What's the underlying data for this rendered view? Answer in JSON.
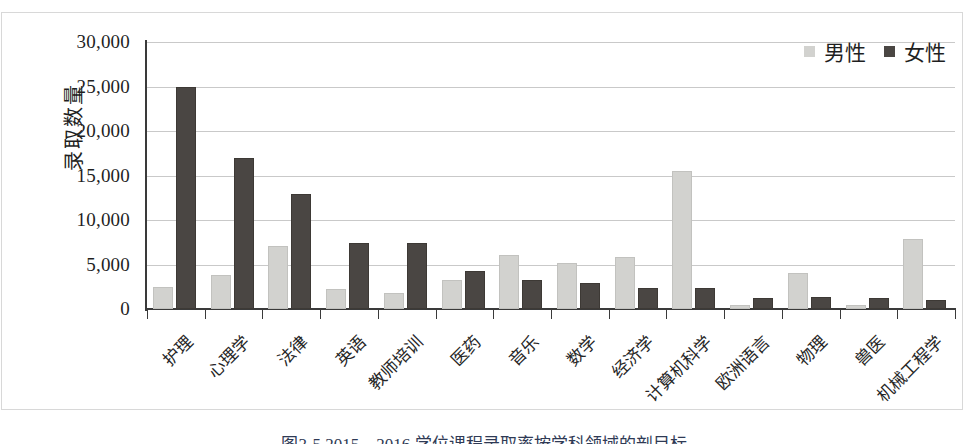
{
  "chart_data": {
    "type": "bar",
    "title": "",
    "xlabel": "",
    "ylabel": "录取数量",
    "ylim": [
      0,
      30000
    ],
    "ytick_labels": [
      "30,000",
      "25,000",
      "20,000",
      "15,000",
      "10,000",
      "5,000",
      "0"
    ],
    "ytick_values": [
      30000,
      25000,
      20000,
      15000,
      10000,
      5000,
      0
    ],
    "grid": true,
    "legend_position": "top-right",
    "categories": [
      "护理",
      "心理学",
      "法律",
      "英语",
      "教师培训",
      "医药",
      "音乐",
      "数学",
      "经济学",
      "计算机科学",
      "欧洲语言",
      "物理",
      "兽医",
      "机械工程学"
    ],
    "series": [
      {
        "name": "男性",
        "color": "#d2d2cf",
        "values": [
          2500,
          3800,
          7100,
          2200,
          1800,
          3300,
          6100,
          5200,
          5900,
          15500,
          400,
          4000,
          500,
          7900
        ]
      },
      {
        "name": "女性",
        "color": "#4a4643",
        "values": [
          25000,
          17000,
          12900,
          7400,
          7400,
          4300,
          3300,
          2900,
          2400,
          2400,
          1200,
          1300,
          1200,
          1000
        ]
      }
    ]
  },
  "caption": {
    "text": "图3-5  2015—2016 学位课程录取率按学科领域的剖目标"
  }
}
